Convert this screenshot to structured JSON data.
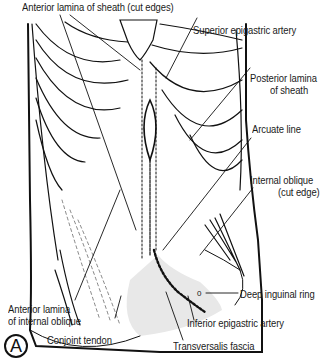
{
  "figure": {
    "panel_letter": "A",
    "labels": {
      "anterior_lamina_sheath": "Anterior lamina of sheath (cut edges)",
      "superior_epigastric_artery": "Superior epigastric artery",
      "posterior_lamina_line1": "Posterior lamina",
      "posterior_lamina_line2": "of sheath",
      "arcuate_line": "Arcuate line",
      "internal_oblique_line1": "Internal oblique",
      "internal_oblique_line2": "(cut edge)",
      "deep_inguinal_ring": "Deep inguinal ring",
      "anterior_lamina_io_line1": "Anterior lamina",
      "anterior_lamina_io_line2": "of internal oblique",
      "conjoint_tendon": "Conjoint tendon",
      "inferior_epigastric_artery": "Inferior epigastric artery",
      "transversalis_fascia": "Transversalis fascia"
    },
    "colors": {
      "ink": "#111111",
      "shade": "#e6e6e6",
      "background": "#ffffff"
    }
  }
}
